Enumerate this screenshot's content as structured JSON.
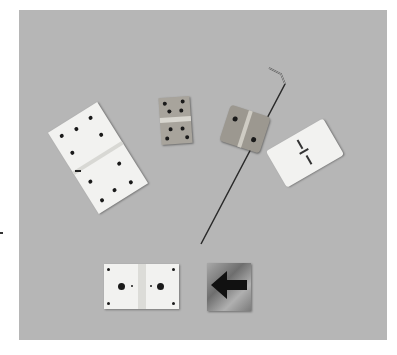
{
  "image": {
    "subject": "Assorted hinges on a gray background",
    "background_color": "#b6b6b6",
    "objects": [
      {
        "name": "large-white-perforated-hinge",
        "color": "#f2f2f0"
      },
      {
        "name": "small-metal-pinned-hinge",
        "color": "#a8a49c"
      },
      {
        "name": "metal-hinge-with-bent-wire-pin",
        "color": "#9c9890"
      },
      {
        "name": "white-slotted-film-hinge",
        "color": "#f2f2f0"
      },
      {
        "name": "white-square-hinge-two-large-holes",
        "color": "#f2f2f0"
      },
      {
        "name": "metal-plate-with-black-arrow",
        "color": "#8f8f8f"
      }
    ]
  }
}
